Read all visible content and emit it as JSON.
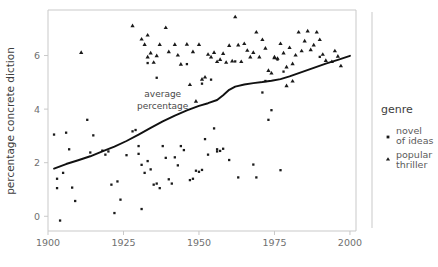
{
  "chart_data": {
    "type": "scatter",
    "title": "",
    "xlabel": "",
    "ylabel": "percentage concrete diction",
    "xlim": [
      1900,
      2002
    ],
    "ylim": [
      -0.55,
      7.7
    ],
    "xticks": [
      1900,
      1925,
      1950,
      1975,
      2000
    ],
    "xtick_labels": [
      "1900",
      "1925",
      "1950",
      "1975",
      "2000"
    ],
    "yticks": [
      0,
      2,
      4,
      6
    ],
    "ytick_labels": [
      "0",
      "2",
      "4",
      "6"
    ],
    "grid": false,
    "legend": {
      "title": "genre",
      "position": "right",
      "entries": [
        {
          "label_line1": "novel",
          "label_line2": "of ideas",
          "marker": "square",
          "color": "#1a1a1a"
        },
        {
          "label_line1": "popular",
          "label_line2": "thriller",
          "marker": "triangle",
          "color": "#1a1a1a"
        }
      ]
    },
    "annotations": [
      {
        "text_line1": "average",
        "text_line2": "percentage",
        "x": 1938,
        "y": 4.45
      }
    ],
    "trend_line": {
      "name": "average percentage",
      "color": "#111111",
      "points": [
        [
          1902,
          1.78
        ],
        [
          1906,
          1.95
        ],
        [
          1910,
          2.09
        ],
        [
          1914,
          2.24
        ],
        [
          1918,
          2.42
        ],
        [
          1922,
          2.6
        ],
        [
          1926,
          2.81
        ],
        [
          1930,
          3.05
        ],
        [
          1934,
          3.3
        ],
        [
          1938,
          3.54
        ],
        [
          1942,
          3.76
        ],
        [
          1946,
          3.95
        ],
        [
          1950,
          4.12
        ],
        [
          1953,
          4.22
        ],
        [
          1956,
          4.34
        ],
        [
          1958,
          4.52
        ],
        [
          1960,
          4.72
        ],
        [
          1962,
          4.84
        ],
        [
          1965,
          4.92
        ],
        [
          1968,
          4.97
        ],
        [
          1971,
          5.01
        ],
        [
          1974,
          5.06
        ],
        [
          1977,
          5.12
        ],
        [
          1980,
          5.22
        ],
        [
          1984,
          5.38
        ],
        [
          1988,
          5.54
        ],
        [
          1992,
          5.7
        ],
        [
          1996,
          5.84
        ],
        [
          2000,
          5.99
        ]
      ]
    },
    "series": [
      {
        "name": "novel of ideas",
        "marker": "square",
        "color": "#1a1a1a",
        "points": [
          [
            1902,
            3.05
          ],
          [
            1903,
            1.4
          ],
          [
            1903,
            1.05
          ],
          [
            1904,
            -0.16
          ],
          [
            1906,
            3.12
          ],
          [
            1907,
            2.5
          ],
          [
            1908,
            1.07
          ],
          [
            1909,
            0.57
          ],
          [
            1913,
            3.6
          ],
          [
            1914,
            2.38
          ],
          [
            1915,
            3.02
          ],
          [
            1918,
            2.45
          ],
          [
            1919,
            2.3
          ],
          [
            1920,
            2.42
          ],
          [
            1921,
            1.18
          ],
          [
            1922,
            0.12
          ],
          [
            1923,
            1.3
          ],
          [
            1924,
            0.62
          ],
          [
            1928,
            3.17
          ],
          [
            1929,
            3.22
          ],
          [
            1930,
            2.62
          ],
          [
            1930,
            2.33
          ],
          [
            1931,
            0.27
          ],
          [
            1931,
            1.92
          ],
          [
            1932,
            1.62
          ],
          [
            1933,
            2.06
          ],
          [
            1934,
            1.75
          ],
          [
            1935,
            1.18
          ],
          [
            1936,
            1.22
          ],
          [
            1937,
            1.05
          ],
          [
            1938,
            2.62
          ],
          [
            1939,
            2.18
          ],
          [
            1940,
            1.38
          ],
          [
            1941,
            1.22
          ],
          [
            1942,
            2.2
          ],
          [
            1943,
            1.9
          ],
          [
            1945,
            2.47
          ],
          [
            1946,
            5.68
          ],
          [
            1948,
            1.4
          ],
          [
            1949,
            1.7
          ],
          [
            1950,
            1.66
          ],
          [
            1951,
            1.73
          ],
          [
            1952,
            2.88
          ],
          [
            1953,
            2.3
          ],
          [
            1955,
            3.28
          ],
          [
            1956,
            2.5
          ],
          [
            1956,
            2.42
          ],
          [
            1957,
            2.44
          ],
          [
            1958,
            2.52
          ],
          [
            1960,
            2.1
          ],
          [
            1963,
            1.45
          ],
          [
            1968,
            1.93
          ],
          [
            1969,
            1.45
          ],
          [
            1971,
            4.62
          ],
          [
            1973,
            3.6
          ],
          [
            1974,
            3.96
          ],
          [
            1977,
            1.72
          ],
          [
            1936,
            5.17
          ],
          [
            1944,
            2.62
          ],
          [
            1933,
            5.72
          ],
          [
            1951,
            4.95
          ],
          [
            1954,
            5.1
          ],
          [
            1962,
            5.78
          ],
          [
            1972,
            5.05
          ],
          [
            1976,
            5.85
          ],
          [
            1978,
            5.4
          ],
          [
            1990,
            5.95
          ],
          [
            1905,
            1.62
          ],
          [
            1926,
            2.28
          ],
          [
            1947,
            1.35
          ]
        ]
      },
      {
        "name": "popular thriller",
        "marker": "triangle",
        "color": "#1a1a1a",
        "points": [
          [
            1911,
            6.12
          ],
          [
            1928,
            7.12
          ],
          [
            1932,
            6.42
          ],
          [
            1933,
            5.95
          ],
          [
            1933,
            6.77
          ],
          [
            1934,
            6.1
          ],
          [
            1935,
            5.75
          ],
          [
            1937,
            6.42
          ],
          [
            1939,
            7.05
          ],
          [
            1942,
            6.42
          ],
          [
            1944,
            5.68
          ],
          [
            1946,
            6.43
          ],
          [
            1947,
            4.92
          ],
          [
            1949,
            4.3
          ],
          [
            1950,
            6.42
          ],
          [
            1951,
            5.12
          ],
          [
            1952,
            5.2
          ],
          [
            1953,
            6.05
          ],
          [
            1954,
            5.95
          ],
          [
            1955,
            6.12
          ],
          [
            1956,
            5.78
          ],
          [
            1957,
            5.86
          ],
          [
            1958,
            6.08
          ],
          [
            1959,
            5.75
          ],
          [
            1960,
            6.38
          ],
          [
            1961,
            5.8
          ],
          [
            1962,
            7.45
          ],
          [
            1963,
            6.4
          ],
          [
            1964,
            5.78
          ],
          [
            1965,
            6.45
          ],
          [
            1966,
            6.2
          ],
          [
            1968,
            6.12
          ],
          [
            1969,
            6.88
          ],
          [
            1970,
            5.95
          ],
          [
            1971,
            6.6
          ],
          [
            1972,
            6.28
          ],
          [
            1973,
            5.45
          ],
          [
            1974,
            5.35
          ],
          [
            1975,
            5.95
          ],
          [
            1975,
            5.92
          ],
          [
            1976,
            5.9
          ],
          [
            1977,
            6.45
          ],
          [
            1978,
            6.1
          ],
          [
            1979,
            5.58
          ],
          [
            1980,
            6.3
          ],
          [
            1981,
            5.7
          ],
          [
            1982,
            6.02
          ],
          [
            1983,
            6.88
          ],
          [
            1984,
            6.18
          ],
          [
            1985,
            6.55
          ],
          [
            1986,
            6.92
          ],
          [
            1987,
            6.22
          ],
          [
            1988,
            6.4
          ],
          [
            1989,
            6.88
          ],
          [
            1990,
            6.6
          ],
          [
            1991,
            6.05
          ],
          [
            1992,
            5.82
          ],
          [
            1994,
            5.78
          ],
          [
            1995,
            6.18
          ],
          [
            1996,
            5.98
          ],
          [
            1997,
            5.62
          ],
          [
            1931,
            6.62
          ],
          [
            1936,
            6.0
          ],
          [
            1940,
            6.15
          ],
          [
            1943,
            6.02
          ],
          [
            1948,
            6.15
          ],
          [
            1967,
            5.95
          ],
          [
            1979,
            4.88
          ],
          [
            1981,
            5.05
          ]
        ]
      }
    ]
  }
}
